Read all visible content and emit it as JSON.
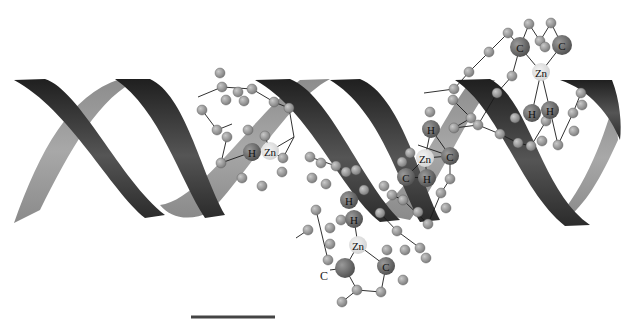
{
  "figure": {
    "background": "#ffffff",
    "ribbon_dark": "#2e2e2e",
    "ribbon_light": "#9a9a9a",
    "atom_small_color": "#8a8a8a",
    "atom_large_color": "#5e5e5e",
    "zn_color": "#dcdcdc"
  },
  "scale_bar": {
    "x1": 191,
    "x2": 275,
    "y": 317,
    "color": "#444444",
    "label": ""
  },
  "zinc_fingers": [
    {
      "id": "zf-1",
      "labels": [
        {
          "text": "H",
          "x": 252,
          "y": 152,
          "r": 9,
          "kind": "large"
        },
        {
          "text": "Zn",
          "x": 270,
          "y": 151,
          "r": 9,
          "kind": "zn"
        }
      ],
      "atoms": [
        [
          220,
          73
        ],
        [
          222,
          87
        ],
        [
          238,
          92
        ],
        [
          252,
          89
        ],
        [
          226,
          100
        ],
        [
          244,
          101
        ],
        [
          274,
          102
        ],
        [
          289,
          108
        ],
        [
          202,
          110
        ],
        [
          217,
          130
        ],
        [
          248,
          130
        ],
        [
          227,
          137
        ],
        [
          265,
          136
        ],
        [
          283,
          158
        ],
        [
          221,
          163
        ],
        [
          242,
          178
        ],
        [
          262,
          186
        ],
        [
          282,
          172
        ]
      ],
      "bonds": [
        [
          [
            198,
            97
          ],
          [
            222,
            87
          ]
        ],
        [
          [
            222,
            87
          ],
          [
            252,
            89
          ]
        ],
        [
          [
            252,
            89
          ],
          [
            274,
            102
          ]
        ],
        [
          [
            274,
            102
          ],
          [
            289,
            108
          ]
        ],
        [
          [
            289,
            108
          ],
          [
            294,
            137
          ]
        ],
        [
          [
            294,
            137
          ],
          [
            270,
            151
          ]
        ],
        [
          [
            202,
            110
          ],
          [
            217,
            130
          ]
        ],
        [
          [
            217,
            130
          ],
          [
            232,
            124
          ]
        ],
        [
          [
            227,
            137
          ],
          [
            221,
            163
          ]
        ],
        [
          [
            221,
            163
          ],
          [
            252,
            152
          ]
        ],
        [
          [
            270,
            151
          ],
          [
            283,
            158
          ]
        ],
        [
          [
            294,
            137
          ],
          [
            283,
            158
          ]
        ],
        [
          [
            265,
            136
          ],
          [
            270,
            151
          ]
        ]
      ]
    },
    {
      "id": "zf-2",
      "labels": [
        {
          "text": "H",
          "x": 349,
          "y": 200,
          "r": 9,
          "kind": "large"
        },
        {
          "text": "H",
          "x": 354,
          "y": 219,
          "r": 9,
          "kind": "large"
        },
        {
          "text": "Zn",
          "x": 358,
          "y": 245,
          "r": 9,
          "kind": "zn"
        },
        {
          "text": "C",
          "x": 386,
          "y": 266,
          "r": 9,
          "kind": "large"
        }
      ],
      "free_labels": [
        {
          "text": "C",
          "x": 324,
          "y": 276
        }
      ],
      "extra_large_atoms": [
        [
          345,
          268
        ]
      ],
      "atoms": [
        [
          310,
          157
        ],
        [
          321,
          163
        ],
        [
          336,
          166
        ],
        [
          346,
          172
        ],
        [
          312,
          178
        ],
        [
          326,
          184
        ],
        [
          316,
          210
        ],
        [
          308,
          230
        ],
        [
          330,
          228
        ],
        [
          341,
          220
        ],
        [
          356,
          170
        ],
        [
          364,
          190
        ],
        [
          384,
          186
        ],
        [
          380,
          213
        ],
        [
          397,
          231
        ],
        [
          387,
          250
        ],
        [
          405,
          250
        ],
        [
          420,
          248
        ],
        [
          426,
          258
        ],
        [
          403,
          280
        ],
        [
          381,
          292
        ],
        [
          357,
          290
        ],
        [
          342,
          302
        ],
        [
          328,
          260
        ],
        [
          330,
          244
        ]
      ],
      "bonds": [
        [
          [
            310,
            157
          ],
          [
            336,
            166
          ]
        ],
        [
          [
            336,
            166
          ],
          [
            346,
            172
          ]
        ],
        [
          [
            354,
            219
          ],
          [
            358,
            245
          ]
        ],
        [
          [
            358,
            245
          ],
          [
            345,
            268
          ]
        ],
        [
          [
            358,
            245
          ],
          [
            386,
            266
          ]
        ],
        [
          [
            345,
            268
          ],
          [
            330,
            270
          ]
        ],
        [
          [
            345,
            268
          ],
          [
            357,
            290
          ]
        ],
        [
          [
            357,
            290
          ],
          [
            342,
            302
          ]
        ],
        [
          [
            386,
            266
          ],
          [
            381,
            292
          ]
        ],
        [
          [
            381,
            292
          ],
          [
            357,
            290
          ]
        ],
        [
          [
            380,
            213
          ],
          [
            397,
            231
          ]
        ],
        [
          [
            397,
            231
          ],
          [
            420,
            248
          ]
        ],
        [
          [
            316,
            210
          ],
          [
            328,
            260
          ]
        ],
        [
          [
            308,
            230
          ],
          [
            296,
            238
          ]
        ]
      ]
    },
    {
      "id": "zf-3",
      "labels": [
        {
          "text": "H",
          "x": 431,
          "y": 129,
          "r": 9,
          "kind": "large"
        },
        {
          "text": "Zn",
          "x": 425,
          "y": 158,
          "r": 9,
          "kind": "zn"
        },
        {
          "text": "C",
          "x": 450,
          "y": 156,
          "r": 9,
          "kind": "large"
        },
        {
          "text": "C",
          "x": 406,
          "y": 177,
          "r": 9,
          "kind": "large"
        },
        {
          "text": "H",
          "x": 427,
          "y": 178,
          "r": 9,
          "kind": "large"
        }
      ],
      "atoms": [
        [
          430,
          112
        ],
        [
          410,
          153
        ],
        [
          402,
          162
        ],
        [
          450,
          179
        ],
        [
          441,
          193
        ],
        [
          403,
          200
        ],
        [
          418,
          212
        ],
        [
          392,
          195
        ],
        [
          428,
          224
        ],
        [
          446,
          208
        ]
      ],
      "bonds": [
        [
          [
            431,
            129
          ],
          [
            425,
            158
          ]
        ],
        [
          [
            425,
            158
          ],
          [
            450,
            156
          ]
        ],
        [
          [
            425,
            158
          ],
          [
            406,
            177
          ]
        ],
        [
          [
            425,
            158
          ],
          [
            427,
            178
          ]
        ],
        [
          [
            431,
            129
          ],
          [
            450,
            156
          ]
        ],
        [
          [
            406,
            177
          ],
          [
            427,
            178
          ]
        ],
        [
          [
            450,
            156
          ],
          [
            450,
            179
          ]
        ],
        [
          [
            450,
            179
          ],
          [
            441,
            193
          ]
        ],
        [
          [
            441,
            193
          ],
          [
            428,
            224
          ]
        ],
        [
          [
            428,
            224
          ],
          [
            403,
            200
          ]
        ],
        [
          [
            403,
            200
          ],
          [
            392,
            195
          ]
        ],
        [
          [
            418,
            145
          ],
          [
            450,
            156
          ]
        ]
      ]
    },
    {
      "id": "zf-4",
      "labels": [
        {
          "text": "C",
          "x": 520,
          "y": 47,
          "r": 10,
          "kind": "large"
        },
        {
          "text": "C",
          "x": 562,
          "y": 45,
          "r": 10,
          "kind": "large"
        },
        {
          "text": "Zn",
          "x": 541,
          "y": 72,
          "r": 9,
          "kind": "zn"
        },
        {
          "text": "H",
          "x": 532,
          "y": 113,
          "r": 9,
          "kind": "large"
        },
        {
          "text": "H",
          "x": 550,
          "y": 110,
          "r": 9,
          "kind": "large"
        }
      ],
      "atoms": [
        [
          508,
          33
        ],
        [
          529,
          24
        ],
        [
          551,
          23
        ],
        [
          540,
          41
        ],
        [
          545,
          47
        ],
        [
          489,
          52
        ],
        [
          469,
          72
        ],
        [
          512,
          76
        ],
        [
          454,
          89
        ],
        [
          497,
          93
        ],
        [
          471,
          118
        ],
        [
          453,
          100
        ],
        [
          454,
          128
        ],
        [
          478,
          125
        ],
        [
          500,
          134
        ],
        [
          515,
          118
        ],
        [
          518,
          143
        ],
        [
          531,
          146
        ],
        [
          542,
          141
        ],
        [
          546,
          121
        ],
        [
          558,
          145
        ],
        [
          573,
          113
        ],
        [
          574,
          131
        ],
        [
          581,
          93
        ],
        [
          582,
          105
        ]
      ],
      "bonds": [
        [
          [
            508,
            33
          ],
          [
            489,
            52
          ]
        ],
        [
          [
            489,
            52
          ],
          [
            469,
            72
          ]
        ],
        [
          [
            469,
            72
          ],
          [
            454,
            89
          ]
        ],
        [
          [
            508,
            33
          ],
          [
            520,
            47
          ]
        ],
        [
          [
            520,
            47
          ],
          [
            529,
            24
          ]
        ],
        [
          [
            529,
            24
          ],
          [
            540,
            41
          ]
        ],
        [
          [
            540,
            41
          ],
          [
            551,
            23
          ]
        ],
        [
          [
            551,
            23
          ],
          [
            562,
            45
          ]
        ],
        [
          [
            520,
            47
          ],
          [
            541,
            72
          ]
        ],
        [
          [
            562,
            45
          ],
          [
            541,
            72
          ]
        ],
        [
          [
            541,
            72
          ],
          [
            532,
            113
          ]
        ],
        [
          [
            541,
            72
          ],
          [
            550,
            110
          ]
        ],
        [
          [
            520,
            47
          ],
          [
            512,
            76
          ]
        ],
        [
          [
            512,
            76
          ],
          [
            497,
            93
          ]
        ],
        [
          [
            497,
            93
          ],
          [
            478,
            125
          ]
        ],
        [
          [
            478,
            125
          ],
          [
            454,
            128
          ]
        ],
        [
          [
            454,
            128
          ],
          [
            471,
            118
          ]
        ],
        [
          [
            471,
            118
          ],
          [
            453,
            100
          ]
        ],
        [
          [
            478,
            125
          ],
          [
            500,
            134
          ]
        ],
        [
          [
            500,
            134
          ],
          [
            518,
            143
          ]
        ],
        [
          [
            518,
            143
          ],
          [
            531,
            146
          ]
        ],
        [
          [
            531,
            146
          ],
          [
            546,
            121
          ]
        ],
        [
          [
            550,
            110
          ],
          [
            558,
            145
          ]
        ],
        [
          [
            558,
            145
          ],
          [
            573,
            113
          ]
        ],
        [
          [
            573,
            113
          ],
          [
            581,
            93
          ]
        ],
        [
          [
            454,
            89
          ],
          [
            424,
            93
          ]
        ]
      ]
    }
  ]
}
